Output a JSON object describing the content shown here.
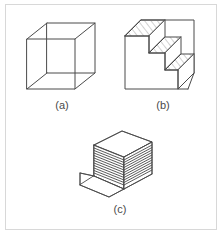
{
  "page": {
    "background_color": "#ffffff",
    "frame_border_color": "#d8d8d8",
    "line_color": "#4a4a4a",
    "hatch_color": "#9a9a9a",
    "caption_color": "#4a4a4a"
  },
  "figures": [
    {
      "id": "a",
      "caption": "(a)",
      "name": "necker-cube",
      "description": "Wireframe cube (Necker cube)"
    },
    {
      "id": "b",
      "caption": "(b)",
      "name": "schroeder-staircase",
      "description": "Staircase with three hatched steps inside a square outline"
    },
    {
      "id": "c",
      "caption": "(c)",
      "name": "layer-stack",
      "description": "Stack of thin sheets drawn in parallel projection"
    }
  ]
}
